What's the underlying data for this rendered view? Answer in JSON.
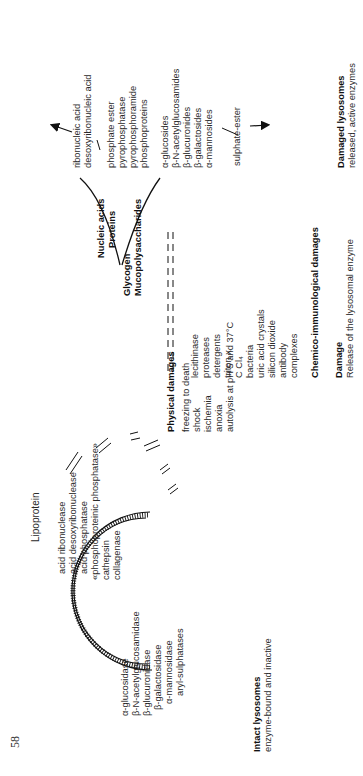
{
  "page_number": "58",
  "lipoprotein_label": "Lipoprotein",
  "intact": {
    "title": "Intact lysosomes",
    "subtitle": "enzyme-bound and inactive",
    "enzymes_group1": [
      "acid ribonuclease",
      "acid desoxyribonuclease",
      "acid phosphatase",
      "«phosphoproteinic phosphatase»",
      "cathepsin",
      "collagenase"
    ],
    "enzymes_group2": [
      "α-glucosidase",
      "β-N-acetylglucosamidase",
      "β-glucuronidase",
      "β-galactosidase",
      "α-mannosidase",
      "aryl-sulphatases"
    ]
  },
  "physical": {
    "title": "Physical damages",
    "items": [
      "freezing to death",
      "shock",
      "ischemia",
      "anoxia",
      "autolysis at pH 5 and 37°C"
    ]
  },
  "chemico": {
    "title": "Chemico-immunological damages",
    "items": [
      "lecithinase",
      "proteases",
      "detergents",
      "triton x",
      "C Cl₄",
      "bacteria",
      "uric acid crystals",
      "silicon dioxide",
      "antibody",
      "complexes"
    ]
  },
  "damage": {
    "title": "Damage",
    "subtitle": "Release of the lysosomal enzyme"
  },
  "substrates": {
    "group1": [
      "Nucleic acids",
      "Proteins"
    ],
    "group2": [
      "Glycogen",
      "Mucopolysaccharides"
    ]
  },
  "products": {
    "nucleic": [
      "ribonucleic acid",
      "desoxyribonucleic acid"
    ],
    "phospho": [
      "phosphate ester",
      "pyrophosphatase",
      "pyrophosphoramide",
      "phosphoproteins"
    ],
    "glyco": [
      "α-glucosides",
      "β-N-acetylglucosamides",
      "β-glucuronides",
      "β-galactosides",
      "α-mannosides"
    ],
    "sulphate": "sulphate-ester"
  },
  "damaged": {
    "title": "Damaged lysosomes",
    "subtitle": "released, active enzymes"
  }
}
